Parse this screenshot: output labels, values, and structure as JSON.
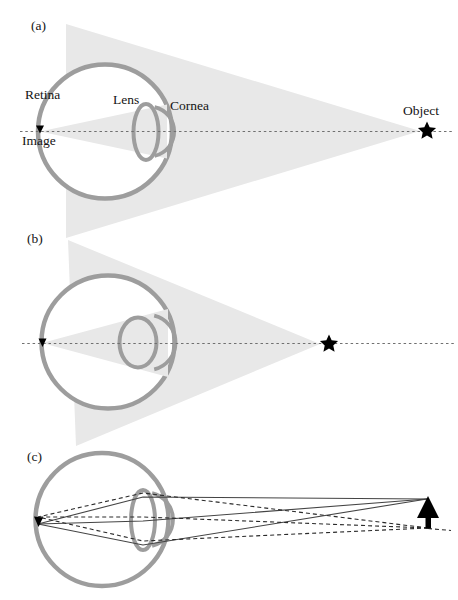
{
  "panels": {
    "a": {
      "tag": "(a)",
      "labels": {
        "retina": "Retina",
        "lens": "Lens",
        "cornea": "Cornea",
        "image": "Image",
        "object": "Object"
      }
    },
    "b": {
      "tag": "(b)"
    },
    "c": {
      "tag": "(c)"
    }
  },
  "colors": {
    "cone_fill": "#e8e8e8",
    "eye_outline": "#9d9d9d",
    "axis_dash": "#707070",
    "ray_solid": "#444444",
    "ray_dashed": "#2a2a2a",
    "ink": "#000000"
  }
}
